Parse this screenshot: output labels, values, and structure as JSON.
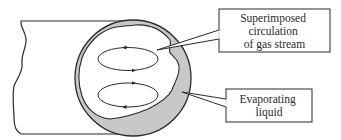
{
  "diagram": {
    "type": "cross-section",
    "colors": {
      "stroke": "#2a2a2a",
      "liquid_fill": "#c8c8c8",
      "background": "#ffffff",
      "box_fill": "#ffffff"
    },
    "labels": {
      "circulation": {
        "line1": "Superimposed",
        "line2": "circulation",
        "line3": "of gas stream"
      },
      "liquid": {
        "line1": "Evaporating",
        "line2": "liquid"
      }
    },
    "circulation_cells": [
      {
        "name": "upper",
        "direction": "counter-clockwise"
      },
      {
        "name": "lower",
        "direction": "clockwise"
      }
    ]
  }
}
